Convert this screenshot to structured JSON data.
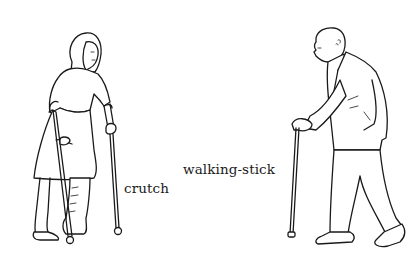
{
  "illustration": {
    "labels": {
      "crutch": "crutch",
      "walking_stick": "walking-stick"
    },
    "figures": [
      {
        "id": "woman-with-crutches",
        "depicts": "woman walking with two crutches, leg in cast"
      },
      {
        "id": "old-man-with-walking-stick",
        "depicts": "elderly bald man walking with a walking-stick"
      }
    ],
    "colors": {
      "ink": "#1a1a1a",
      "background": "#ffffff"
    }
  }
}
